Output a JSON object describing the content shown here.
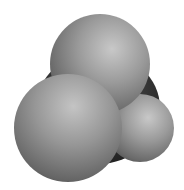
{
  "image": {
    "subject": "space-filling molecular model",
    "geometry": "tetrahedral",
    "atoms": [
      {
        "role": "central-atom",
        "shade": "dark"
      },
      {
        "role": "outer-atom-top",
        "shade": "light"
      },
      {
        "role": "outer-atom-left",
        "shade": "light"
      },
      {
        "role": "outer-atom-right",
        "shade": "light"
      }
    ],
    "colors": {
      "background": "#ffffff",
      "outer_atom_highlight": "#c8c8c8",
      "outer_atom_mid": "#8c8c8c",
      "outer_atom_shadow": "#505050",
      "central_atom_highlight": "#5a5a5a",
      "central_atom_shadow": "#1e1e1e"
    }
  }
}
